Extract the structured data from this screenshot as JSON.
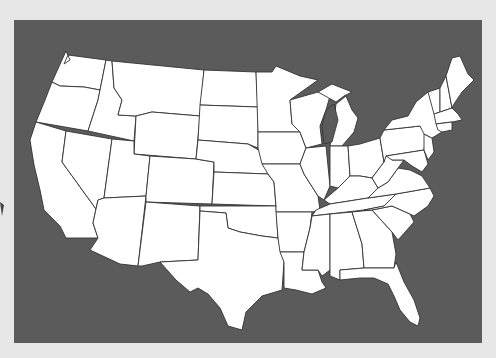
{
  "map": {
    "title": "",
    "region": "Contiguous United States",
    "style": "blank outline map",
    "colors": {
      "background": "#e6e6e6",
      "water": "#5b5b5b",
      "land": "#ffffff",
      "borders": "#333333"
    },
    "labels": []
  }
}
